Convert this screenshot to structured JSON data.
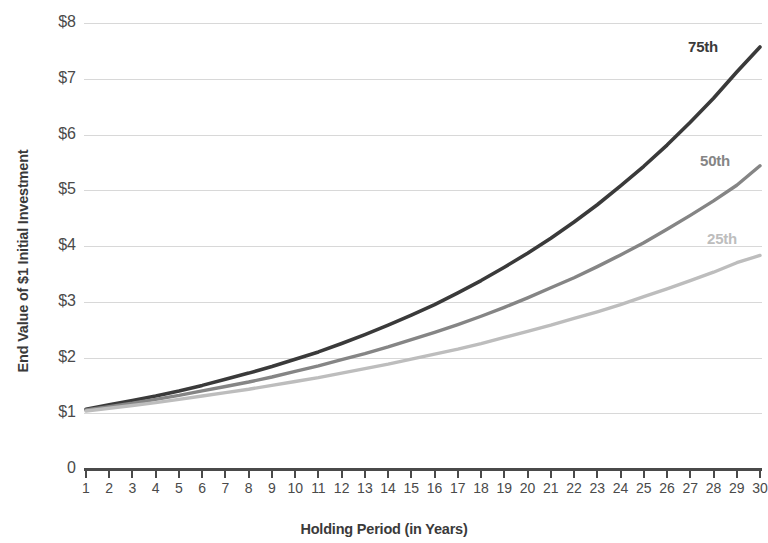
{
  "chart_data": {
    "type": "line",
    "title": "",
    "xlabel": "Holding Period (in Years)",
    "ylabel": "End Value of $1 Initial Investment",
    "xlim": [
      0,
      30
    ],
    "ylim": [
      0,
      8
    ],
    "grid": true,
    "legend_position": "inline-right-end-of-line",
    "x_tick_labels": [
      "1",
      "2",
      "3",
      "4",
      "5",
      "6",
      "7",
      "8",
      "9",
      "10",
      "11",
      "12",
      "13",
      "14",
      "15",
      "16",
      "17",
      "18",
      "19",
      "20",
      "21",
      "22",
      "23",
      "24",
      "25",
      "26",
      "27",
      "28",
      "29",
      "30"
    ],
    "y_tick_labels": [
      "$8",
      "$7",
      "$6",
      "$5",
      "$4",
      "$3",
      "$2",
      "$1",
      "0"
    ],
    "y_tick_values": [
      8,
      7,
      6,
      5,
      4,
      3,
      2,
      1,
      0
    ],
    "x": [
      1,
      2,
      3,
      4,
      5,
      6,
      7,
      8,
      9,
      10,
      11,
      12,
      13,
      14,
      15,
      16,
      17,
      18,
      19,
      20,
      21,
      22,
      23,
      24,
      25,
      26,
      27,
      28,
      29,
      30
    ],
    "series": [
      {
        "name": "75th",
        "label": "75th",
        "color": "#3a3a3a",
        "values": [
          1.07,
          1.15,
          1.23,
          1.31,
          1.4,
          1.5,
          1.61,
          1.72,
          1.84,
          1.97,
          2.1,
          2.25,
          2.41,
          2.58,
          2.76,
          2.95,
          3.16,
          3.38,
          3.62,
          3.87,
          4.14,
          4.43,
          4.74,
          5.08,
          5.43,
          5.81,
          6.22,
          6.65,
          7.12,
          7.57
        ]
      },
      {
        "name": "50th",
        "label": "50th",
        "color": "#858585",
        "values": [
          1.06,
          1.12,
          1.18,
          1.25,
          1.32,
          1.4,
          1.48,
          1.56,
          1.65,
          1.75,
          1.85,
          1.96,
          2.07,
          2.19,
          2.32,
          2.45,
          2.59,
          2.74,
          2.9,
          3.07,
          3.25,
          3.43,
          3.63,
          3.84,
          4.06,
          4.3,
          4.55,
          4.81,
          5.09,
          5.44
        ]
      },
      {
        "name": "25th",
        "label": "25th",
        "color": "#bdbdbd",
        "values": [
          1.04,
          1.09,
          1.14,
          1.19,
          1.25,
          1.31,
          1.37,
          1.43,
          1.5,
          1.57,
          1.64,
          1.72,
          1.8,
          1.88,
          1.97,
          2.06,
          2.15,
          2.25,
          2.36,
          2.47,
          2.58,
          2.7,
          2.82,
          2.95,
          3.09,
          3.23,
          3.38,
          3.53,
          3.7,
          3.83
        ]
      }
    ]
  },
  "axes": {
    "y_title": "End Value of $1 Initial Investment",
    "x_title": "Holding Period (in Years)"
  },
  "colors": {
    "grid": "#d8d8d8",
    "axis": "#4a4a4a",
    "text": "#3d3d3d",
    "p75": "#3a3a3a",
    "p50": "#858585",
    "p25": "#bdbdbd"
  }
}
